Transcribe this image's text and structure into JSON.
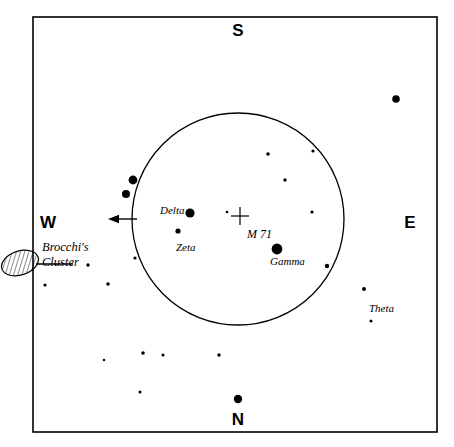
{
  "chart": {
    "kind": "star-finder-chart",
    "title": "",
    "background_color": "#ffffff",
    "ink_color": "#000000",
    "border": {
      "x": 33,
      "y": 17,
      "width": 404,
      "height": 415,
      "stroke_width": 1.6
    }
  },
  "cardinals": [
    {
      "name": "south",
      "label": "S",
      "x": 238,
      "y": 30
    },
    {
      "name": "north",
      "label": "N",
      "x": 238,
      "y": 419
    },
    {
      "name": "west",
      "label": "W",
      "x": 48,
      "y": 222
    },
    {
      "name": "east",
      "label": "E",
      "x": 410,
      "y": 222
    }
  ],
  "field_circle": {
    "name": "finder-field-of-view",
    "cx": 238,
    "cy": 219,
    "r": 106,
    "stroke_width": 1.3
  },
  "direction_arrow": {
    "name": "west-direction-arrow",
    "x1": 137,
    "y1": 219,
    "x2": 108,
    "y2": 219,
    "head_length": 11,
    "head_half_width": 4.2,
    "stroke_width": 1.4
  },
  "cluster_marker": {
    "name": "brocchis-cluster-ellipse",
    "cx": 20,
    "cy": 263,
    "rx": 19,
    "ry": 12,
    "rotation": -18,
    "hatch_spacing": 4,
    "leader": {
      "x1": 36,
      "y1": 264,
      "x2": 73,
      "y2": 264,
      "stroke_width": 1.6
    }
  },
  "labels": [
    {
      "name": "label-brocchis-cluster",
      "lines": [
        "Brocchi's",
        "Cluster"
      ],
      "x": 42,
      "y": 240,
      "style": "cluster"
    },
    {
      "name": "label-delta",
      "text": "Delta",
      "x": 160,
      "y": 204,
      "style": "star"
    },
    {
      "name": "label-zeta",
      "text": "Zeta",
      "x": 176,
      "y": 241,
      "style": "star"
    },
    {
      "name": "label-gamma",
      "text": "Gamma",
      "x": 270,
      "y": 255,
      "style": "star"
    },
    {
      "name": "label-theta",
      "text": "Theta",
      "x": 369,
      "y": 302,
      "style": "star"
    },
    {
      "name": "label-m71",
      "text": "M 71",
      "x": 247,
      "y": 228,
      "style": "obj"
    }
  ],
  "deep_sky_marker": {
    "name": "m71-cross-marker",
    "cx": 240,
    "cy": 216,
    "arm": 9,
    "stroke_width": 1.2
  },
  "stars": [
    {
      "name": "star-gamma",
      "x": 277,
      "y": 249,
      "r": 5.4
    },
    {
      "name": "star-delta",
      "x": 190,
      "y": 213,
      "r": 4.6
    },
    {
      "name": "star-upper-right-field",
      "x": 396,
      "y": 99,
      "r": 3.8
    },
    {
      "name": "star-near-north-label",
      "x": 238,
      "y": 399,
      "r": 4.2
    },
    {
      "name": "star-west-edge-upper",
      "x": 133,
      "y": 180,
      "r": 4.4
    },
    {
      "name": "star-west-edge-lower",
      "x": 126,
      "y": 194,
      "r": 4.0
    },
    {
      "name": "star-zeta",
      "x": 178,
      "y": 231,
      "r": 2.6
    },
    {
      "name": "star-faint-m71-companion",
      "x": 227,
      "y": 212,
      "r": 1.3
    },
    {
      "name": "star-field-ne-inner",
      "x": 285,
      "y": 180,
      "r": 1.7
    },
    {
      "name": "star-field-ne-outer",
      "x": 312,
      "y": 212,
      "r": 1.6
    },
    {
      "name": "star-field-ne-high",
      "x": 313,
      "y": 151,
      "r": 1.6
    },
    {
      "name": "star-field-ne-top",
      "x": 268,
      "y": 154,
      "r": 1.8
    },
    {
      "name": "star-field-east-rim",
      "x": 327,
      "y": 266,
      "r": 2.2
    },
    {
      "name": "star-theta",
      "x": 364,
      "y": 289,
      "r": 2.0
    },
    {
      "name": "star-below-theta",
      "x": 371,
      "y": 321,
      "r": 1.5
    },
    {
      "name": "star-sw-inner-rim",
      "x": 135,
      "y": 258,
      "r": 1.6
    },
    {
      "name": "star-sw-outer",
      "x": 108,
      "y": 284,
      "r": 1.8
    },
    {
      "name": "star-cluster-right",
      "x": 88,
      "y": 265,
      "r": 1.7
    },
    {
      "name": "star-below-cluster",
      "x": 45,
      "y": 285,
      "r": 1.6
    },
    {
      "name": "star-south-field-a",
      "x": 143,
      "y": 353,
      "r": 1.8
    },
    {
      "name": "star-south-field-b",
      "x": 163,
      "y": 355,
      "r": 1.5
    },
    {
      "name": "star-south-field-c",
      "x": 219,
      "y": 355,
      "r": 1.7
    },
    {
      "name": "star-south-field-d",
      "x": 104,
      "y": 360,
      "r": 1.2
    },
    {
      "name": "star-south-field-e",
      "x": 140,
      "y": 392,
      "r": 1.5
    }
  ]
}
